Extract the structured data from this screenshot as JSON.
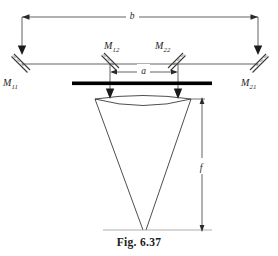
{
  "figure": {
    "caption": "Fig. 6.37",
    "colors": {
      "line": "#3a3a3a",
      "beam_bar": "#000000",
      "text": "#1d1d1d",
      "background": "#ffffff"
    }
  },
  "mirrors": [
    {
      "id": "M11",
      "base": "M",
      "sub": "11",
      "label": "M11",
      "position": "outer-left"
    },
    {
      "id": "M12",
      "base": "M",
      "sub": "12",
      "label": "M12",
      "position": "inner-left"
    },
    {
      "id": "M22",
      "base": "M",
      "sub": "22",
      "label": "M22",
      "position": "inner-right"
    },
    {
      "id": "M21",
      "base": "M",
      "sub": "21",
      "label": "M21",
      "position": "outer-right"
    }
  ],
  "dimensions": [
    {
      "id": "b",
      "label": "b",
      "span": "outer-mirror-separation"
    },
    {
      "id": "a",
      "label": "a",
      "span": "inner-mirror-separation"
    },
    {
      "id": "f",
      "label": "f",
      "span": "lens-focal-length"
    }
  ],
  "elements": {
    "lens_label": "converging-lens",
    "detector_bar_label": "beam-bar",
    "cone_label": "converging-beam-cone"
  }
}
